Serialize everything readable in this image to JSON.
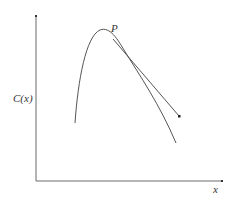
{
  "diagram": {
    "type": "function-curve-with-tangent",
    "labels": {
      "y_axis": "C(x)",
      "x_axis": "x",
      "point": "P"
    },
    "colors": {
      "axis": "#6b6b6b",
      "curve": "#555555",
      "tangent": "#555555",
      "text": "#333333"
    },
    "axes": {
      "origin": [
        36,
        181
      ],
      "y_axis_top": [
        36,
        16
      ],
      "x_axis_right": [
        222,
        181
      ]
    },
    "curve": {
      "start": [
        75,
        123
      ],
      "peak": [
        100,
        30
      ],
      "end": [
        176,
        143
      ]
    },
    "tangent": {
      "from_point": "P",
      "start": [
        116,
        43
      ],
      "end": [
        179,
        117
      ],
      "arrow": true
    }
  }
}
